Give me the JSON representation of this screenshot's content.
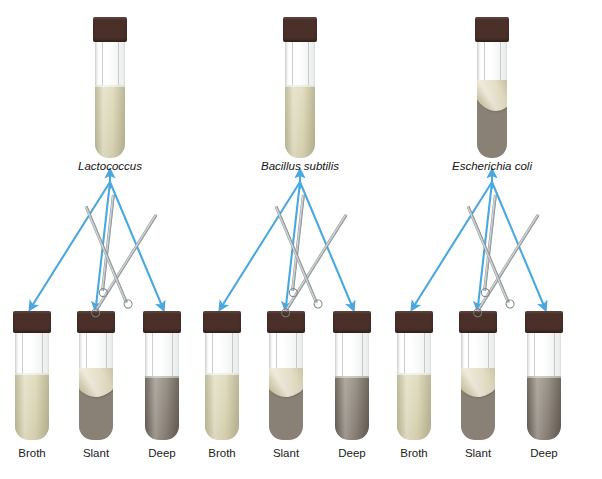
{
  "figure": {
    "caption_faint": "",
    "arrow_color": "#4aa8e0",
    "cap_color": "#4a3028",
    "broth_color": "#d8d4b4",
    "agar_color": "#8a8176",
    "slant_surface_color": "#ddd5b8"
  },
  "groups": [
    {
      "id": "lactococcus",
      "species": "Lactococcus",
      "source_tube": {
        "media_type": "broth"
      },
      "targets": [
        {
          "label": "Broth",
          "media_type": "broth",
          "instrument": "loop"
        },
        {
          "label": "Slant",
          "media_type": "slant",
          "instrument": "needle"
        },
        {
          "label": "Deep",
          "media_type": "deep",
          "instrument": "loop"
        }
      ]
    },
    {
      "id": "bacillus-subtilis",
      "species": "Bacillus subtilis",
      "source_tube": {
        "media_type": "broth"
      },
      "targets": [
        {
          "label": "Broth",
          "media_type": "broth",
          "instrument": "loop"
        },
        {
          "label": "Slant",
          "media_type": "slant",
          "instrument": "needle"
        },
        {
          "label": "Deep",
          "media_type": "deep",
          "instrument": "loop"
        }
      ]
    },
    {
      "id": "escherichia-coli",
      "species": "Escherichia coli",
      "source_tube": {
        "media_type": "slant"
      },
      "targets": [
        {
          "label": "Broth",
          "media_type": "broth",
          "instrument": "loop"
        },
        {
          "label": "Slant",
          "media_type": "slant",
          "instrument": "needle"
        },
        {
          "label": "Deep",
          "media_type": "deep",
          "instrument": "loop"
        }
      ]
    }
  ]
}
